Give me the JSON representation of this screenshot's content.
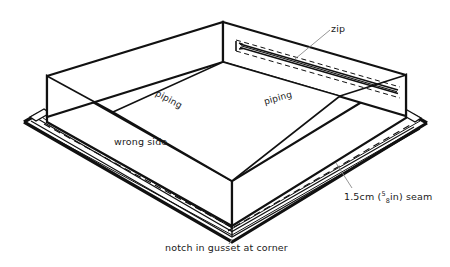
{
  "figure": {
    "type": "technical-sewing-diagram",
    "projection": "isometric",
    "line_color": "#111111",
    "background_color": "#ffffff",
    "leader_color": "#8a8a8a",
    "dash_color": "#111111"
  },
  "labels": {
    "zip": "zip",
    "piping_left": "piping",
    "piping_right": "piping",
    "wrong_side": "wrong side",
    "seam_prefix": "1.5cm (",
    "seam_frac_num": "5",
    "seam_frac_den": "8",
    "seam_suffix": "in) seam",
    "notch": "notch in gusset at corner"
  },
  "annotations": [
    {
      "name": "zip",
      "text": "zip",
      "leader": true
    },
    {
      "name": "piping-left",
      "text": "piping",
      "leader": false
    },
    {
      "name": "piping-right",
      "text": "piping",
      "leader": false
    },
    {
      "name": "wrong-side",
      "text": "wrong side",
      "leader": false
    },
    {
      "name": "seam-allowance",
      "text": "1.5cm (5/8in) seam",
      "leader": true
    },
    {
      "name": "notch-in-gusset",
      "text": "notch in gusset at corner",
      "leader": true
    }
  ]
}
